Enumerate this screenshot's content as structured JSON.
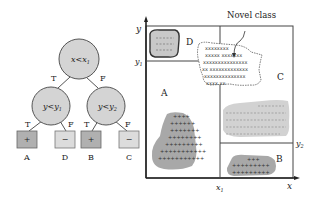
{
  "tree": {
    "root": {
      "label": "x<x",
      "sub": "1"
    },
    "left": {
      "label": "y<y",
      "sub": "1"
    },
    "right": {
      "label": "y<y",
      "sub": "2"
    },
    "edges": {
      "root_left": "T",
      "root_right": "F",
      "left_left": "T",
      "left_right": "F",
      "right_left": "T",
      "right_right": "F"
    },
    "leaves": [
      {
        "symbol": "+",
        "label": "A"
      },
      {
        "symbol": "−",
        "label": "D"
      },
      {
        "symbol": "+",
        "label": "B"
      },
      {
        "symbol": "−",
        "label": "C"
      }
    ]
  },
  "plot": {
    "y_axis": "y",
    "x_axis": "x",
    "y1": "y",
    "y1_sub": "1",
    "y2": "y",
    "y2_sub": "2",
    "x1": "x",
    "x1_sub": "1",
    "regions": {
      "A": "A",
      "B": "B",
      "C": "C",
      "D": "D"
    },
    "novel_class": "Novel class"
  },
  "colors": {
    "positive_box": "#b0b0b0",
    "negative_box": "#dcdcdc",
    "node_fill": "#d4d4d4",
    "blob_dark": "#a8a8a8",
    "blob_light": "#d2d2d2"
  }
}
